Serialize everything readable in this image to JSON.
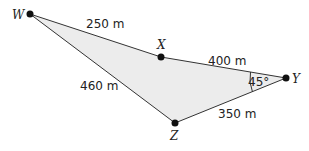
{
  "diagram": {
    "points": {
      "W": {
        "label": "W",
        "x": 30,
        "y": 14
      },
      "X": {
        "label": "X",
        "x": 161,
        "y": 57
      },
      "Y": {
        "label": "Y",
        "x": 286,
        "y": 78
      },
      "Z": {
        "label": "Z",
        "x": 175,
        "y": 123
      }
    },
    "segments": {
      "WX": "250 m",
      "XY": "400 m",
      "WZ": "460 m",
      "ZY": "350 m"
    },
    "angle_Y": "45°",
    "fill_color": "#ececec",
    "line_color": "#333333"
  }
}
